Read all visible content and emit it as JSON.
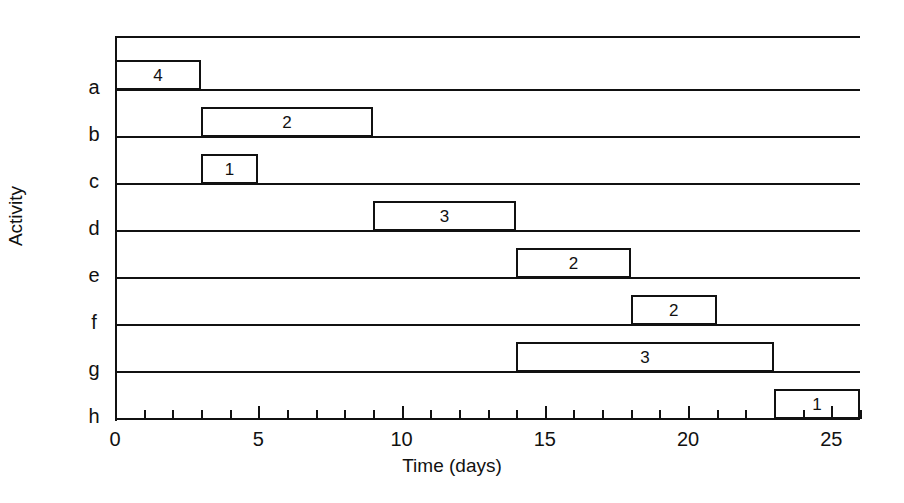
{
  "chart_data": {
    "type": "bar",
    "title": "",
    "xlabel": "Time (days)",
    "ylabel": "Activity",
    "xlim": [
      0,
      26
    ],
    "xticks": [
      0,
      5,
      10,
      15,
      20,
      25
    ],
    "xtick_labels": [
      "0",
      "5",
      "10",
      "15",
      "20",
      "25"
    ],
    "minor_tick_interval": 1,
    "categories": [
      "a",
      "b",
      "c",
      "d",
      "e",
      "f",
      "g",
      "h"
    ],
    "grid": true,
    "legend": null,
    "orientation": "horizontal",
    "note": "Gantt chart of activities a-h; each bar is labelled with a resource/crew number",
    "bars": [
      {
        "activity": "a",
        "start": 0,
        "end": 3,
        "duration": 3,
        "label": "4"
      },
      {
        "activity": "b",
        "start": 3,
        "end": 9,
        "duration": 6,
        "label": "2"
      },
      {
        "activity": "c",
        "start": 3,
        "end": 5,
        "duration": 2,
        "label": "1"
      },
      {
        "activity": "d",
        "start": 9,
        "end": 14,
        "duration": 5,
        "label": "3"
      },
      {
        "activity": "e",
        "start": 14,
        "end": 18,
        "duration": 4,
        "label": "2"
      },
      {
        "activity": "f",
        "start": 18,
        "end": 21,
        "duration": 3,
        "label": "2"
      },
      {
        "activity": "g",
        "start": 14,
        "end": 23,
        "duration": 9,
        "label": "3"
      },
      {
        "activity": "h",
        "start": 23,
        "end": 26,
        "duration": 3,
        "label": "1"
      }
    ]
  },
  "axes": {
    "x_title": "Time (days)",
    "y_title": "Activity"
  },
  "colors": {
    "ink": "#111111",
    "background": "#ffffff"
  }
}
